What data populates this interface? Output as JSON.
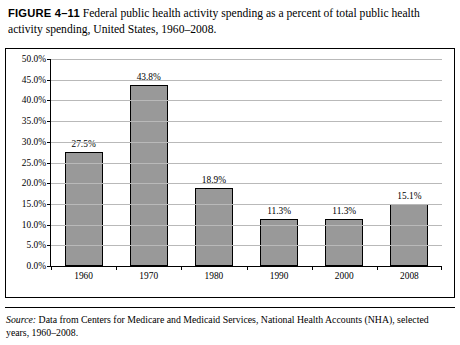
{
  "figure": {
    "label": "FIGURE 4–11",
    "caption": "Federal public health activity spending as a percent of total public health activity spending, United States, 1960–2008.",
    "source_label": "Source:",
    "source_text": " Data from Centers for Medicare and Medicaid Services, National Health Accounts (NHA), selected years, 1960–2008."
  },
  "chart_data": {
    "type": "bar",
    "title": "",
    "xlabel": "",
    "ylabel": "",
    "categories": [
      "1960",
      "1970",
      "1980",
      "1990",
      "2000",
      "2008"
    ],
    "values": [
      27.5,
      43.8,
      18.9,
      11.3,
      11.3,
      15.1
    ],
    "data_labels": [
      "27.5%",
      "43.8%",
      "18.9%",
      "11.3%",
      "11.3%",
      "15.1%"
    ],
    "ylim": [
      0,
      50
    ],
    "ytick_labels": [
      "50.0%",
      "45.0%",
      "40.0%",
      "35.0%",
      "30.0%",
      "25.0%",
      "20.0%",
      "15.0%",
      "10.0%",
      "5.0%",
      "0.0%"
    ],
    "ytick_values": [
      50,
      45,
      40,
      35,
      30,
      25,
      20,
      15,
      10,
      5,
      0
    ],
    "grid": true,
    "legend": "none",
    "bar_color": "#999999",
    "bar_border_color": "#000000",
    "grid_color": "#b9b9b9"
  }
}
